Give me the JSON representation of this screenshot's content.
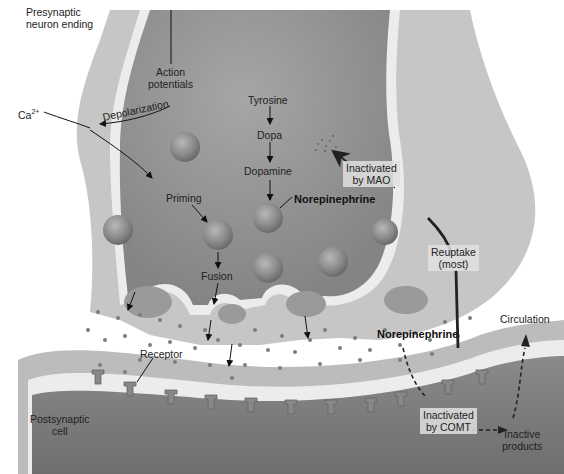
{
  "figure": {
    "colors": {
      "presynaptic_outer": "#c9c9c9",
      "presynaptic_inner": "#8f8f8f",
      "membrane_light": "#efefef",
      "postsynaptic_outer": "#bdbdbd",
      "postsynaptic_inner": "#7d7d7d",
      "vesicle": "#8a8a8a",
      "molecule": "#7a7a7a",
      "background": "#ffffff"
    },
    "labels": {
      "presynaptic": "Presynaptic\nneuron ending",
      "action_potentials": "Action\npotentials",
      "depolarization": "Depolarization",
      "calcium": "Ca",
      "calcium_charge": "2+",
      "tyrosine": "Tyrosine",
      "dopa": "Dopa",
      "dopamine": "Dopamine",
      "norepinephrine_vesicle": "Norepinephrine",
      "inactivated_mao": "Inactivated\nby MAO",
      "priming": "Priming",
      "fusion": "Fusion",
      "reuptake": "Reuptake\n(most)",
      "norepinephrine_cleft": "Norepinephrine",
      "circulation": "Circulation",
      "receptor": "Receptor",
      "postsynaptic": "Postsynaptic\ncell",
      "inactivated_comt": "Inactivated\nby COMT",
      "inactive_products": "Inactive\nproducts"
    },
    "synthesis_pathway": [
      "Tyrosine",
      "Dopa",
      "Dopamine",
      "Norepinephrine"
    ]
  }
}
